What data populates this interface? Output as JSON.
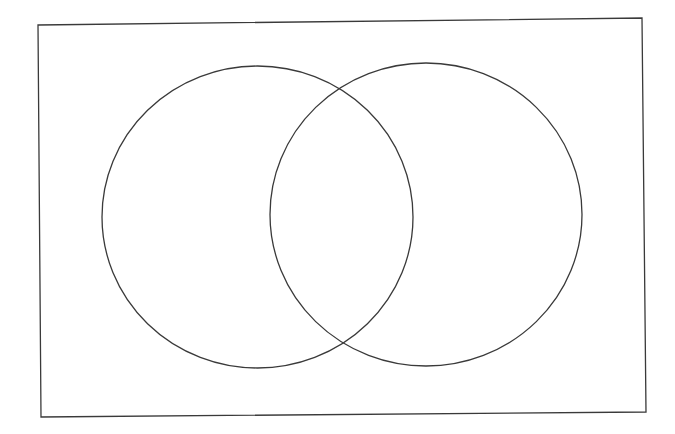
{
  "diagram": {
    "type": "venn",
    "sets": [
      {
        "id": "left",
        "label": ""
      },
      {
        "id": "right",
        "label": ""
      }
    ],
    "universe_box": {
      "label": ""
    },
    "colors": {
      "stroke": "#3a3a3a",
      "background": "#ffffff"
    }
  }
}
